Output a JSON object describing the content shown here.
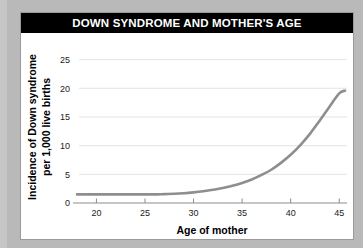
{
  "figure": {
    "title": "DOWN SYNDROME AND MOTHER'S AGE",
    "card_background": "#ffffff",
    "backdrop_color": "#b9b9b9",
    "title_bar_color": "#000000",
    "title_text_color": "#ffffff"
  },
  "chart_data": {
    "type": "line",
    "title": "DOWN SYNDROME AND MOTHER'S AGE",
    "subtitle": "",
    "xlabel": "Age of mother",
    "ylabel": "Incidence of Down syndrome per 1,000 live births",
    "ylabel_line1": "Incidence of Down syndrome",
    "ylabel_line2": "per 1,000 live births",
    "xlim": [
      18.0,
      45.8
    ],
    "ylim": [
      0,
      26.5
    ],
    "xticks": [
      20,
      25,
      30,
      35,
      40,
      45
    ],
    "yticks": [
      0,
      5,
      10,
      15,
      20,
      25
    ],
    "xtick_labels": [
      "20",
      "25",
      "30",
      "35",
      "40",
      "45"
    ],
    "ytick_labels": [
      "0",
      "5",
      "10",
      "15",
      "20",
      "25"
    ],
    "grid": "horizontal",
    "legend": "none",
    "series": [
      {
        "name": "Incidence of Down syndrome per 1,000 live births",
        "color": "#8e8e8e",
        "line_width": 2.6,
        "x": [
          18,
          19,
          20,
          21,
          22,
          23,
          24,
          25,
          26,
          27,
          28,
          29,
          30,
          31,
          32,
          33,
          34,
          35,
          36,
          37,
          38,
          39,
          40,
          41,
          42,
          43,
          44,
          45,
          45.6
        ],
        "values": [
          1.5,
          1.5,
          1.5,
          1.5,
          1.5,
          1.5,
          1.5,
          1.5,
          1.5,
          1.55,
          1.6,
          1.7,
          1.85,
          2.05,
          2.3,
          2.6,
          3.0,
          3.5,
          4.1,
          4.9,
          5.8,
          7.0,
          8.4,
          10.1,
          12.1,
          14.4,
          16.8,
          19.1,
          19.6
        ]
      }
    ],
    "annotations": []
  }
}
